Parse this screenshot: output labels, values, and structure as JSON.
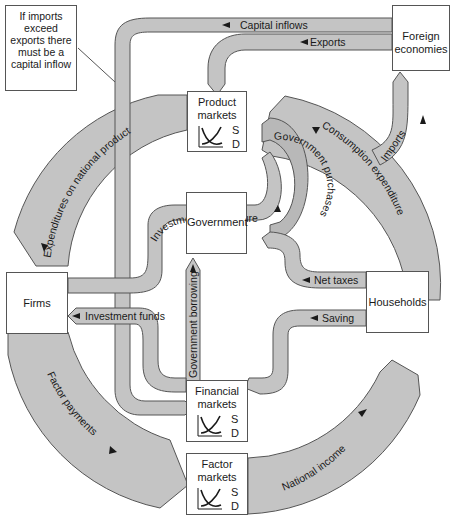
{
  "diagram": {
    "colors": {
      "flow_fill": "#c4c4c4",
      "flow_fill_dark": "#b5b5b5",
      "flow_stroke": "#555555",
      "box_border": "#555555",
      "background": "#ffffff"
    },
    "nodes": {
      "foreign": {
        "label": "Foreign economies"
      },
      "product": {
        "label": "Product markets",
        "s": "S",
        "d": "D"
      },
      "government": {
        "label": "Government"
      },
      "firms": {
        "label": "Firms"
      },
      "households": {
        "label": "Households"
      },
      "financial": {
        "label": "Financial markets",
        "s": "S",
        "d": "D"
      },
      "factor": {
        "label": "Factor markets",
        "s": "S",
        "d": "D"
      }
    },
    "note": {
      "text": "If imports exceed exports there must be a capital inflow"
    },
    "flows": {
      "capital_inflows": "Capital inflows",
      "exports": "Exports",
      "imports": "Imports",
      "expenditures_national_product": "Expenditures on national product",
      "consumption_expenditure": "Consumption expenditure",
      "government_purchases": "Government purchases",
      "investment_expenditure": "Investment expenditure",
      "government_borrowing": "Government borrowing",
      "net_taxes": "Net taxes",
      "saving": "Saving",
      "investment_funds": "Investment funds",
      "factor_payments": "Factor payments",
      "national_income": "National income"
    }
  }
}
